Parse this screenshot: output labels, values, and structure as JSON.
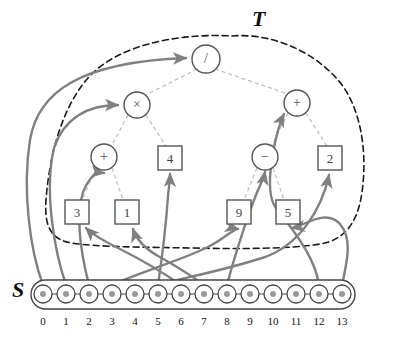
{
  "figure": {
    "labels": {
      "tree_label": "T",
      "sequence_label": "S"
    },
    "colors": {
      "tree_edge": "#b9b9b9",
      "mapping_arrow": "#808080",
      "boundary_dashed": "#1a1a1a",
      "node_stroke": "#555555",
      "sequence_stroke": "#444444",
      "sequence_dot": "#9a9a9a",
      "text": "#111111"
    }
  },
  "tree": {
    "label": "T",
    "nodes": [
      {
        "id": "root",
        "text": "/",
        "shape": "circle",
        "level": 0,
        "cx": 206,
        "cy": 59,
        "r": 14
      },
      {
        "id": "mul",
        "text": "×",
        "shape": "circle",
        "level": 1,
        "cx": 137,
        "cy": 105,
        "r": 13
      },
      {
        "id": "add_r",
        "text": "+",
        "shape": "circle",
        "level": 1,
        "cx": 297,
        "cy": 103,
        "r": 13
      },
      {
        "id": "add_l",
        "text": "+",
        "shape": "circle",
        "level": 2,
        "cx": 104,
        "cy": 157,
        "r": 13
      },
      {
        "id": "four",
        "text": "4",
        "shape": "square",
        "level": 2,
        "cx": 170,
        "cy": 158,
        "s": 24
      },
      {
        "id": "sub",
        "text": "−",
        "shape": "circle",
        "level": 2,
        "cx": 265,
        "cy": 157,
        "r": 13
      },
      {
        "id": "two",
        "text": "2",
        "shape": "square",
        "level": 2,
        "cx": 330,
        "cy": 158,
        "s": 24
      },
      {
        "id": "three",
        "text": "3",
        "shape": "square",
        "level": 3,
        "cx": 77,
        "cy": 212,
        "s": 24
      },
      {
        "id": "one",
        "text": "1",
        "shape": "square",
        "level": 3,
        "cx": 127,
        "cy": 212,
        "s": 24
      },
      {
        "id": "nine",
        "text": "9",
        "shape": "square",
        "level": 3,
        "cx": 239,
        "cy": 212,
        "s": 24
      },
      {
        "id": "five",
        "text": "5",
        "shape": "square",
        "level": 3,
        "cx": 288,
        "cy": 212,
        "s": 24
      }
    ],
    "edges": [
      {
        "from": "root",
        "to": "mul"
      },
      {
        "from": "root",
        "to": "add_r"
      },
      {
        "from": "mul",
        "to": "add_l"
      },
      {
        "from": "mul",
        "to": "four"
      },
      {
        "from": "add_r",
        "to": "sub"
      },
      {
        "from": "add_r",
        "to": "two"
      },
      {
        "from": "add_l",
        "to": "three"
      },
      {
        "from": "add_l",
        "to": "one"
      },
      {
        "from": "sub",
        "to": "nine"
      },
      {
        "from": "sub",
        "to": "five"
      }
    ],
    "expression": "((3 + 1) × 4) / ((9 − 5) + 2)"
  },
  "sequence": {
    "label": "S",
    "count": 14,
    "indices": [
      "0",
      "1",
      "2",
      "3",
      "4",
      "5",
      "6",
      "7",
      "8",
      "9",
      "10",
      "11",
      "12",
      "13"
    ],
    "x_positions": [
      43,
      66,
      89,
      112,
      135,
      158,
      181,
      204,
      227,
      250,
      273,
      296,
      319,
      342
    ],
    "y": 294,
    "node_radius": 9,
    "dot_radius": 3
  },
  "mappings": [
    {
      "from_index": "0",
      "to_node": "root",
      "label": "0 → /"
    },
    {
      "from_index": "1",
      "to_node": "mul",
      "label": "1 → ×"
    },
    {
      "from_index": "2",
      "to_node": "add_l",
      "label": "2 → +"
    },
    {
      "from_index": "3",
      "to_node": "nine",
      "label": "3 → 9"
    },
    {
      "from_index": "5",
      "to_node": "two",
      "label": "5 → 2"
    },
    {
      "from_index": "6",
      "to_node": "three",
      "label": "6 → 3"
    },
    {
      "from_index": "7",
      "to_node": "one",
      "label": "7 → 1"
    },
    {
      "from_index": "8",
      "to_node": "four",
      "label": "8 → 4"
    },
    {
      "from_index": "9",
      "to_node": "sub",
      "label": "9 → −"
    },
    {
      "from_index": "12",
      "to_node": "add_r",
      "label": "12 → +"
    },
    {
      "from_index": "13",
      "to_node": "five",
      "label": "13 → 5"
    }
  ]
}
